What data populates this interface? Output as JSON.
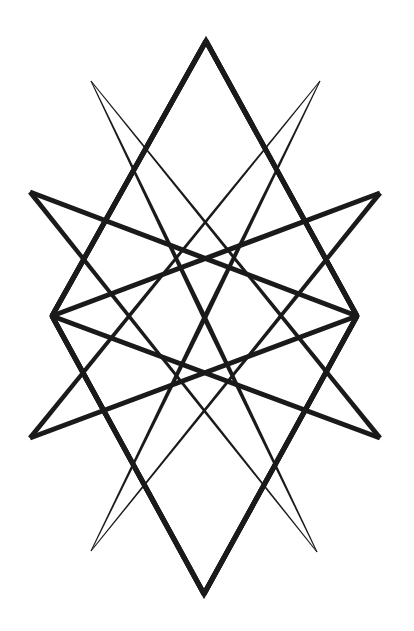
{
  "figure": {
    "background_color": "#ffffff",
    "stroke_color": "#1a1a1a",
    "stroke_width": 5,
    "vertices": {
      "top": [
        206,
        41
      ],
      "bottom": [
        204,
        594
      ],
      "left_mid": [
        52,
        316
      ],
      "right_mid": [
        357,
        316
      ],
      "left_wing_top": [
        30,
        192
      ],
      "left_wing_bottom": [
        30,
        438
      ],
      "right_wing_top": [
        380,
        193
      ],
      "right_wing_bottom": [
        380,
        438
      ],
      "upper_left_spike": [
        91,
        81
      ],
      "upper_right_spike": [
        320,
        81
      ],
      "lower_left_spike": [
        91,
        551
      ],
      "lower_right_spike": [
        317,
        552
      ]
    },
    "segments": [
      {
        "name": "diamond-top-left",
        "from": "top",
        "to": "left_mid",
        "taper": false
      },
      {
        "name": "diamond-bottom-left",
        "from": "left_mid",
        "to": "bottom",
        "taper": false
      },
      {
        "name": "diamond-bottom-right",
        "from": "bottom",
        "to": "right_mid",
        "taper": false
      },
      {
        "name": "diamond-top-right",
        "from": "right_mid",
        "to": "top",
        "taper": false
      },
      {
        "name": "wing-lt-to-right-mid",
        "from": "right_mid",
        "to": "left_wing_top",
        "taper": false
      },
      {
        "name": "wing-rt-to-left-mid",
        "from": "left_mid",
        "to": "right_wing_top",
        "taper": false
      },
      {
        "name": "wing-lb-to-right-mid",
        "from": "right_mid",
        "to": "left_wing_bottom",
        "taper": false
      },
      {
        "name": "wing-rb-to-left-mid",
        "from": "left_mid",
        "to": "right_wing_bottom",
        "taper": false
      },
      {
        "name": "wing-lt-to-lr-spike",
        "from": "left_wing_top",
        "to": "lower_right_spike",
        "taper": true
      },
      {
        "name": "wing-rt-to-ll-spike",
        "from": "right_wing_top",
        "to": "lower_left_spike",
        "taper": true
      },
      {
        "name": "wing-lb-to-ur-spike",
        "from": "left_wing_bottom",
        "to": "upper_right_spike",
        "taper": true
      },
      {
        "name": "wing-rb-to-ul-spike",
        "from": "right_wing_bottom",
        "to": "upper_left_spike",
        "taper": true
      },
      {
        "name": "ul-spike-to-lr-spike",
        "from": "upper_left_spike",
        "to": "lower_right_spike",
        "taper": "both"
      },
      {
        "name": "ur-spike-to-ll-spike",
        "from": "upper_right_spike",
        "to": "lower_left_spike",
        "taper": "both"
      }
    ]
  }
}
